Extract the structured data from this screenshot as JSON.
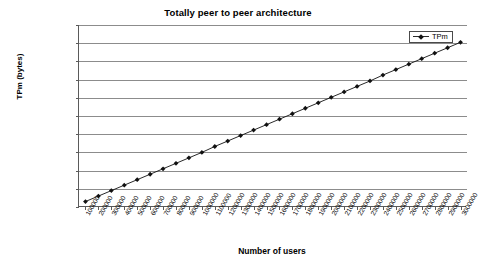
{
  "chart_data": {
    "type": "line",
    "title": "Totally peer to peer architecture",
    "xlabel": "Number of users",
    "ylabel": "TPm (bytes)",
    "grid": true,
    "legend_position": "top-right",
    "xlim": [
      0,
      3000000
    ],
    "ylim": [
      0,
      2000000000
    ],
    "ytick_labels": [
      "2000000000",
      "1800000000",
      "1600000000",
      "1400000000",
      "1200000000",
      "1000000000",
      "800000000",
      "600000000",
      "400000000",
      "200000000",
      "0"
    ],
    "ytick_values": [
      2000000000,
      1800000000,
      1600000000,
      1400000000,
      1200000000,
      1000000000,
      800000000,
      600000000,
      400000000,
      200000000,
      0
    ],
    "categories": [
      "100000",
      "200000",
      "300000",
      "400000",
      "500000",
      "600000",
      "700000",
      "800000",
      "900000",
      "1000000",
      "1100000",
      "1200000",
      "1300000",
      "1400000",
      "1500000",
      "1600000",
      "1700000",
      "1800000",
      "1900000",
      "2000000",
      "2100000",
      "2200000",
      "2300000",
      "2400000",
      "2500000",
      "2600000",
      "2700000",
      "2800000",
      "2900000",
      "3000000"
    ],
    "series": [
      {
        "name": "TPm",
        "marker": "diamond",
        "color": "#111111",
        "values": [
          60000000,
          120000000,
          180000000,
          240000000,
          300000000,
          360000000,
          420000000,
          480000000,
          540000000,
          600000000,
          665000000,
          725000000,
          785000000,
          845000000,
          905000000,
          965000000,
          1025000000,
          1085000000,
          1145000000,
          1205000000,
          1265000000,
          1325000000,
          1385000000,
          1450000000,
          1510000000,
          1570000000,
          1630000000,
          1690000000,
          1750000000,
          1810000000
        ]
      }
    ]
  }
}
